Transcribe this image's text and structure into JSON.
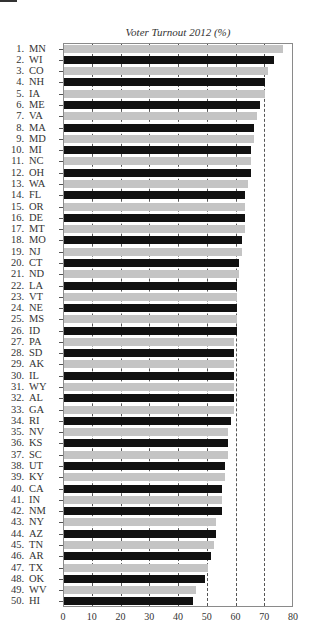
{
  "chart_data": {
    "type": "bar",
    "orientation": "horizontal",
    "title": "Voter Turnout 2012 (%)",
    "xlabel": "",
    "ylabel": "",
    "xlim": [
      0,
      80
    ],
    "xticks": [
      0,
      10,
      20,
      30,
      40,
      50,
      60,
      70,
      80
    ],
    "grid": "vertical dashed lines at 10-70",
    "legend": null,
    "colors": {
      "odd_rank": "#c4c4c4",
      "even_rank": "#111111"
    },
    "categories": [
      "1. MN",
      "2. WI",
      "3. CO",
      "4. NH",
      "5. IA",
      "6. ME",
      "7. VA",
      "8. MA",
      "9. MD",
      "10. MI",
      "11. NC",
      "12. OH",
      "13. WA",
      "14. FL",
      "15. OR",
      "16. DE",
      "17. MT",
      "18. MO",
      "19. NJ",
      "20. CT",
      "21. ND",
      "22. LA",
      "23. VT",
      "24. NE",
      "25. MS",
      "26. ID",
      "27. PA",
      "28. SD",
      "29. AK",
      "30. IL",
      "31. WY",
      "32. AL",
      "33. GA",
      "34. RI",
      "35. NV",
      "36. KS",
      "37. SC",
      "38. UT",
      "39. KY",
      "40. CA",
      "41. IN",
      "42. NM",
      "43. NY",
      "44. AZ",
      "45. TN",
      "46. AR",
      "47. TX",
      "48. OK",
      "49. WV",
      "50. HI"
    ],
    "values": [
      76,
      73,
      71,
      70,
      70,
      68,
      67,
      66,
      66,
      65,
      65,
      65,
      64,
      63,
      63,
      63,
      63,
      62,
      62,
      61,
      61,
      60,
      60,
      60,
      60,
      60,
      59,
      59,
      59,
      59,
      59,
      59,
      59,
      58,
      57,
      57,
      57,
      56,
      56,
      55,
      55,
      55,
      53,
      53,
      52,
      51,
      50,
      49,
      46,
      45
    ]
  },
  "rows": [
    {
      "rank": "1.",
      "state": "MN"
    },
    {
      "rank": "2.",
      "state": "WI"
    },
    {
      "rank": "3.",
      "state": "CO"
    },
    {
      "rank": "4.",
      "state": "NH"
    },
    {
      "rank": "5.",
      "state": "IA"
    },
    {
      "rank": "6.",
      "state": "ME"
    },
    {
      "rank": "7.",
      "state": "VA"
    },
    {
      "rank": "8.",
      "state": "MA"
    },
    {
      "rank": "9.",
      "state": "MD"
    },
    {
      "rank": "10.",
      "state": "MI"
    },
    {
      "rank": "11.",
      "state": "NC"
    },
    {
      "rank": "12.",
      "state": "OH"
    },
    {
      "rank": "13.",
      "state": "WA"
    },
    {
      "rank": "14.",
      "state": "FL"
    },
    {
      "rank": "15.",
      "state": "OR"
    },
    {
      "rank": "16.",
      "state": "DE"
    },
    {
      "rank": "17.",
      "state": "MT"
    },
    {
      "rank": "18.",
      "state": "MO"
    },
    {
      "rank": "19.",
      "state": "NJ"
    },
    {
      "rank": "20.",
      "state": "CT"
    },
    {
      "rank": "21.",
      "state": "ND"
    },
    {
      "rank": "22.",
      "state": "LA"
    },
    {
      "rank": "23.",
      "state": "VT"
    },
    {
      "rank": "24.",
      "state": "NE"
    },
    {
      "rank": "25.",
      "state": "MS"
    },
    {
      "rank": "26.",
      "state": "ID"
    },
    {
      "rank": "27.",
      "state": "PA"
    },
    {
      "rank": "28.",
      "state": "SD"
    },
    {
      "rank": "29.",
      "state": "AK"
    },
    {
      "rank": "30.",
      "state": "IL"
    },
    {
      "rank": "31.",
      "state": "WY"
    },
    {
      "rank": "32.",
      "state": "AL"
    },
    {
      "rank": "33.",
      "state": "GA"
    },
    {
      "rank": "34.",
      "state": "RI"
    },
    {
      "rank": "35.",
      "state": "NV"
    },
    {
      "rank": "36.",
      "state": "KS"
    },
    {
      "rank": "37.",
      "state": "SC"
    },
    {
      "rank": "38.",
      "state": "UT"
    },
    {
      "rank": "39.",
      "state": "KY"
    },
    {
      "rank": "40.",
      "state": "CA"
    },
    {
      "rank": "41.",
      "state": "IN"
    },
    {
      "rank": "42.",
      "state": "NM"
    },
    {
      "rank": "43.",
      "state": "NY"
    },
    {
      "rank": "44.",
      "state": "AZ"
    },
    {
      "rank": "45.",
      "state": "TN"
    },
    {
      "rank": "46.",
      "state": "AR"
    },
    {
      "rank": "47.",
      "state": "TX"
    },
    {
      "rank": "48.",
      "state": "OK"
    },
    {
      "rank": "49.",
      "state": "WV"
    },
    {
      "rank": "50.",
      "state": "HI"
    }
  ],
  "xtick_labels": [
    "0",
    "10",
    "20",
    "30",
    "40",
    "50",
    "60",
    "70",
    "80"
  ]
}
